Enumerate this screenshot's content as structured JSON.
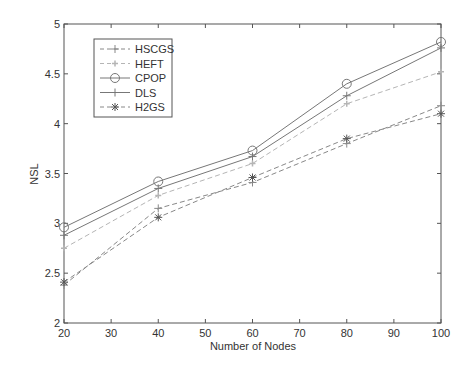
{
  "chart_data": {
    "type": "line",
    "title": "",
    "xlabel": "Number of Nodes",
    "ylabel": "NSL",
    "x": [
      20,
      40,
      60,
      80,
      100
    ],
    "xlim": [
      20,
      100
    ],
    "ylim": [
      2,
      5
    ],
    "xticks": [
      20,
      30,
      40,
      50,
      60,
      70,
      80,
      90,
      100
    ],
    "yticks": [
      2,
      2.5,
      3,
      3.5,
      4,
      4.5,
      5
    ],
    "ytick_labels": [
      "2",
      "2.5",
      "3",
      "3.5",
      "4",
      "4.5",
      "5"
    ],
    "grid": false,
    "legend_position": "upper left",
    "series": [
      {
        "name": "HSCGS",
        "marker": "plus",
        "style": "dashed",
        "values": [
          2.38,
          3.15,
          3.41,
          3.8,
          4.18
        ]
      },
      {
        "name": "HEFT",
        "marker": "dot",
        "style": "dashed-light",
        "values": [
          2.75,
          3.28,
          3.6,
          4.2,
          4.52
        ]
      },
      {
        "name": "CPOP",
        "marker": "circle",
        "style": "solid",
        "values": [
          2.96,
          3.42,
          3.73,
          4.4,
          4.82
        ]
      },
      {
        "name": "DLS",
        "marker": "plus",
        "style": "solid",
        "values": [
          2.88,
          3.35,
          3.67,
          4.28,
          4.76
        ]
      },
      {
        "name": "H2GS",
        "marker": "star",
        "style": "dashed",
        "values": [
          2.41,
          3.06,
          3.46,
          3.85,
          4.1
        ]
      }
    ]
  },
  "colors": {
    "axis": "#555555",
    "line": "#777777",
    "light_line": "#b0b0b0"
  }
}
